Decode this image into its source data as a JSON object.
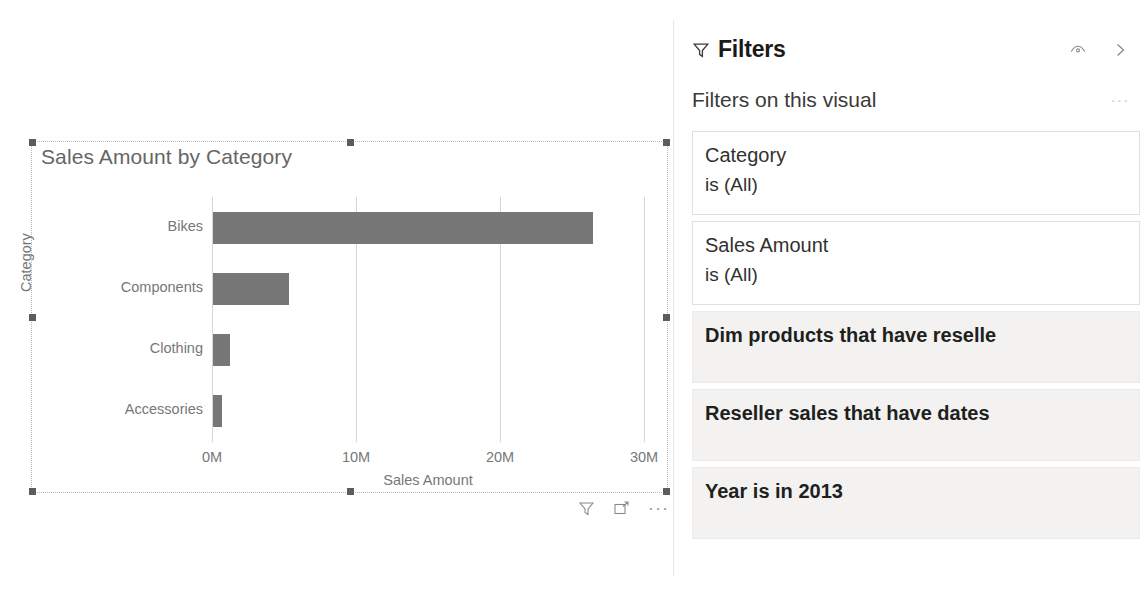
{
  "canvas": {
    "visual": {
      "title": "Sales Amount by Category",
      "footer_icons": [
        {
          "name": "filter-icon",
          "label": "Filters"
        },
        {
          "name": "focus-mode-icon",
          "label": "Focus mode"
        },
        {
          "name": "more-options-icon",
          "label": "More options"
        }
      ]
    }
  },
  "chart_data": {
    "type": "bar",
    "orientation": "horizontal",
    "title": "Sales Amount by Category",
    "xlabel": "Sales Amount",
    "ylabel": "Category",
    "categories": [
      "Bikes",
      "Components",
      "Clothing",
      "Accessories"
    ],
    "values": [
      26400000,
      5300000,
      1200000,
      600000
    ],
    "value_labels": [
      "26.4M",
      "5.3M",
      "1.2M",
      "0.6M"
    ],
    "xlim": [
      0,
      30000000
    ],
    "xticks": [
      0,
      10000000,
      20000000,
      30000000
    ],
    "xticklabels": [
      "0M",
      "10M",
      "20M",
      "30M"
    ],
    "grid": "vertical",
    "bar_color": "#777777",
    "legend": "none"
  },
  "filters_pane": {
    "title": "Filters",
    "funnel_icon": "funnel-icon",
    "actions": [
      {
        "name": "hide-pane-eye-icon",
        "label": "Hide filter pane"
      },
      {
        "name": "collapse-pane-chevron-icon",
        "label": "Collapse filter pane"
      }
    ],
    "section_title": "Filters on this visual",
    "section_more": "···",
    "cards": [
      {
        "name": "Category",
        "value": "is (All)",
        "style": "plain"
      },
      {
        "name": "Sales Amount",
        "value": "is (All)",
        "style": "plain"
      },
      {
        "name": "Dim products that have reselle",
        "value": "",
        "style": "shaded"
      },
      {
        "name": "Reseller sales that have dates",
        "value": "",
        "style": "shaded"
      },
      {
        "name": "Year is in 2013",
        "value": "",
        "style": "shaded"
      }
    ]
  },
  "colors": {
    "bar": "#777777",
    "card_shaded": "#f3f2f1",
    "axis_text": "#777777",
    "title_text": "#1b1a19"
  }
}
